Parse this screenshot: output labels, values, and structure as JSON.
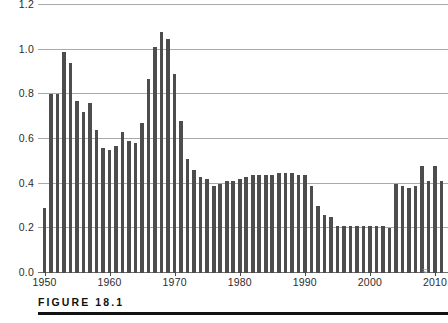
{
  "figure": {
    "caption": "FIGURE  18.1"
  },
  "chart_data": {
    "type": "bar",
    "title": "",
    "subtitle": "",
    "xlabel": "",
    "ylabel": "",
    "xlim": [
      1949,
      2012
    ],
    "ylim": [
      0.0,
      1.2
    ],
    "grid": true,
    "legend": null,
    "bar_color": "#4d4d4d",
    "gridline_color": "#a9a9a9",
    "ytick_labels": [
      "0.0",
      "0.2",
      "0.4",
      "0.6",
      "0.8",
      "1.0",
      "1.2"
    ],
    "ytick_values": [
      0.0,
      0.2,
      0.4,
      0.6,
      0.8,
      1.0,
      1.2
    ],
    "xtick_labels": [
      "1950",
      "1960",
      "1970",
      "1980",
      "1990",
      "2000",
      "2010"
    ],
    "xtick_values": [
      1950,
      1960,
      1970,
      1980,
      1990,
      2000,
      2010
    ],
    "x": [
      1950,
      1951,
      1952,
      1953,
      1954,
      1955,
      1956,
      1957,
      1958,
      1959,
      1960,
      1961,
      1962,
      1963,
      1964,
      1965,
      1966,
      1967,
      1968,
      1969,
      1970,
      1971,
      1972,
      1973,
      1974,
      1975,
      1976,
      1977,
      1978,
      1979,
      1980,
      1981,
      1982,
      1983,
      1984,
      1985,
      1986,
      1987,
      1988,
      1989,
      1990,
      1991,
      1992,
      1993,
      1994,
      1995,
      1996,
      1997,
      1998,
      1999,
      2000,
      2001,
      2002,
      2003,
      2004,
      2005,
      2006,
      2007,
      2008,
      2009,
      2010,
      2011
    ],
    "values": [
      0.29,
      0.8,
      0.8,
      0.99,
      0.94,
      0.77,
      0.72,
      0.76,
      0.64,
      0.56,
      0.55,
      0.57,
      0.63,
      0.59,
      0.58,
      0.67,
      0.87,
      1.01,
      1.08,
      1.05,
      0.89,
      0.68,
      0.51,
      0.46,
      0.43,
      0.42,
      0.39,
      0.4,
      0.41,
      0.41,
      0.42,
      0.43,
      0.44,
      0.44,
      0.44,
      0.44,
      0.45,
      0.45,
      0.45,
      0.44,
      0.44,
      0.39,
      0.3,
      0.26,
      0.25,
      0.21,
      0.21,
      0.21,
      0.21,
      0.21,
      0.21,
      0.21,
      0.21,
      0.2,
      0.4,
      0.39,
      0.38,
      0.39,
      0.48,
      0.41,
      0.48,
      0.41
    ],
    "annotations": [
      {
        "name": "axis-break-mark",
        "glyph": "≈",
        "near_x": 2009
      }
    ]
  }
}
